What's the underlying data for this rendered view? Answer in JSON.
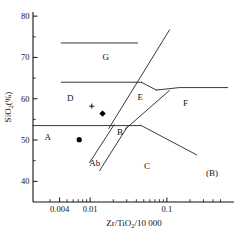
{
  "chart_data": {
    "type": "scatter",
    "title": "",
    "panel_label": "(B)",
    "xlabel": "Zr/TiO2/10 000",
    "xlabel_base": "Zr/TiO",
    "xlabel_sub": "2",
    "xlabel_tail": "/10 000",
    "ylabel": "SiO2(%)",
    "ylabel_base": "SiO",
    "ylabel_sub": "2",
    "ylabel_tail": "(%)",
    "xscale": "log",
    "xlim": [
      0.0018,
      0.75
    ],
    "ylim": [
      35,
      81
    ],
    "grid": false,
    "legend": "none",
    "xticks_major": [
      {
        "value": 0.004,
        "label": "0.004"
      },
      {
        "value": 0.01,
        "label": "0.01"
      },
      {
        "value": 0.1,
        "label": "0.1"
      }
    ],
    "xticks_minor": [
      0.003,
      0.005,
      0.006,
      0.007,
      0.008,
      0.009,
      0.02,
      0.03,
      0.04,
      0.05,
      0.06,
      0.07,
      0.08,
      0.09,
      0.2,
      0.3,
      0.4,
      0.5
    ],
    "yticks_major": [
      {
        "value": 40,
        "label": "40"
      },
      {
        "value": 50,
        "label": "50"
      },
      {
        "value": 60,
        "label": "60"
      },
      {
        "value": 70,
        "label": "70"
      },
      {
        "value": 80,
        "label": "80"
      }
    ],
    "yticks_minor": [
      45,
      55,
      65,
      75
    ],
    "fields": [
      {
        "name": "A",
        "label": "A",
        "x": 0.0028,
        "y": 50.0
      },
      {
        "name": "Ab",
        "label": "Ab",
        "x": 0.0115,
        "y": 43.6
      },
      {
        "name": "B",
        "label": "B",
        "x": 0.0245,
        "y": 51.2
      },
      {
        "name": "C",
        "label": "C",
        "x": 0.055,
        "y": 43.0
      },
      {
        "name": "D",
        "label": "D",
        "x": 0.0055,
        "y": 59.5
      },
      {
        "name": "E",
        "label": "E",
        "x": 0.045,
        "y": 59.6
      },
      {
        "name": "F",
        "label": "F",
        "x": 0.175,
        "y": 58.2
      },
      {
        "name": "G",
        "label": "G",
        "x": 0.016,
        "y": 69.5
      }
    ],
    "series": [
      {
        "name": "sample-circle",
        "marker": "filled-circle",
        "points": [
          {
            "x": 0.0072,
            "y": 50.1
          }
        ]
      },
      {
        "name": "sample-diamond",
        "marker": "filled-diamond",
        "points": [
          {
            "x": 0.0145,
            "y": 56.4
          }
        ]
      },
      {
        "name": "sample-plus",
        "marker": "plus",
        "points": [
          {
            "x": 0.0105,
            "y": 58.2
          }
        ]
      }
    ],
    "boundaries": [
      {
        "name": "top-horizontal-G",
        "points": [
          [
            0.0042,
            73.5
          ],
          [
            0.0415,
            73.5
          ]
        ]
      },
      {
        "name": "G-D-horizontal",
        "points": [
          [
            0.0042,
            64.0
          ],
          [
            0.0465,
            64.0
          ]
        ]
      },
      {
        "name": "A-horizontal",
        "points": [
          [
            0.0018,
            53.5
          ],
          [
            0.0455,
            53.5
          ]
        ]
      },
      {
        "name": "E-G-diagonal",
        "points": [
          [
            0.0175,
            52.8
          ],
          [
            0.1085,
            76.7
          ]
        ]
      },
      {
        "name": "E-F-upper",
        "points": [
          [
            0.0465,
            64.0
          ],
          [
            0.073,
            62.1
          ]
        ]
      },
      {
        "name": "F-horizontal",
        "points": [
          [
            0.073,
            62.1
          ],
          [
            0.145,
            62.7
          ],
          [
            0.62,
            62.7
          ]
        ]
      },
      {
        "name": "C-F-diagonal",
        "points": [
          [
            0.0285,
            52.6
          ],
          [
            0.108,
            62.0
          ]
        ]
      },
      {
        "name": "B-C-diagonal",
        "points": [
          [
            0.0133,
            42.6
          ],
          [
            0.0305,
            53.2
          ]
        ]
      },
      {
        "name": "Ab-left-diagonal",
        "points": [
          [
            0.0098,
            44.5
          ],
          [
            0.0205,
            53.7
          ]
        ]
      },
      {
        "name": "C-right-diagonal",
        "points": [
          [
            0.0455,
            53.6
          ],
          [
            0.245,
            46.4
          ]
        ]
      }
    ]
  }
}
